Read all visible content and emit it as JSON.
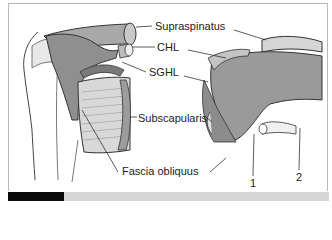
{
  "figure": {
    "labels": {
      "supraspinatus": "Supraspinatus",
      "chl": "CHL",
      "sghl": "SGHL",
      "subscapularis": "Subscapularis",
      "fascia_obliquus": "Fascia obliquus",
      "marker_1": "1",
      "marker_2": "2"
    },
    "colors": {
      "muscle_fill": "#9a9a9a",
      "muscle_light": "#c8c8c8",
      "outline": "#333333",
      "frame_border": "#b9b9b9",
      "bar_black": "#0a0a0a",
      "bar_gray": "#d6d6d6"
    }
  }
}
